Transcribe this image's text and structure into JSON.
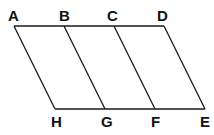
{
  "diagram": {
    "type": "parallelograms",
    "stroke_color": "#1a1a1a",
    "points": {
      "A": {
        "label": "A",
        "x": 14,
        "y": 26
      },
      "B": {
        "label": "B",
        "x": 64,
        "y": 26
      },
      "C": {
        "label": "C",
        "x": 114,
        "y": 26
      },
      "D": {
        "label": "D",
        "x": 164,
        "y": 26
      },
      "H": {
        "label": "H",
        "x": 55,
        "y": 109
      },
      "G": {
        "label": "G",
        "x": 105,
        "y": 109
      },
      "F": {
        "label": "F",
        "x": 155,
        "y": 109
      },
      "E": {
        "label": "E",
        "x": 205,
        "y": 109
      }
    },
    "segments": [
      [
        "A",
        "D"
      ],
      [
        "H",
        "E"
      ],
      [
        "A",
        "H"
      ],
      [
        "B",
        "G"
      ],
      [
        "C",
        "F"
      ],
      [
        "D",
        "E"
      ]
    ]
  }
}
